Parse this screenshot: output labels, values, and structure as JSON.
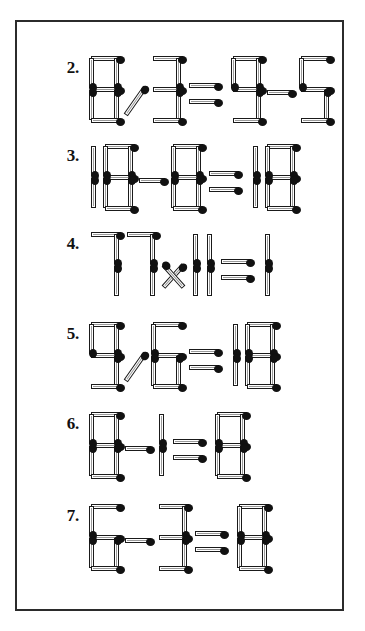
{
  "page": {
    "background_color": "#ffffff",
    "frame_color": "#2b2b2b",
    "match_body_color": "#ffffff",
    "match_outline_color": "#1a1a1a",
    "match_head_color": "#111111",
    "width": 365,
    "height": 631
  },
  "puzzles": [
    {
      "label": "2.",
      "number": "2",
      "equation_text": "8 / 3 ⇒ 9 - 5",
      "tokens": [
        {
          "kind": "digit",
          "value": "8"
        },
        {
          "kind": "operator",
          "value": "/"
        },
        {
          "kind": "digit",
          "value": "3"
        },
        {
          "kind": "operator",
          "value": "⇒"
        },
        {
          "kind": "digit",
          "value": "9"
        },
        {
          "kind": "operator",
          "value": "-"
        },
        {
          "kind": "digit",
          "value": "5"
        }
      ]
    },
    {
      "label": "3.",
      "number": "3",
      "equation_text": "18 - 8 ⇒ 18",
      "tokens": [
        {
          "kind": "digit",
          "value": "1"
        },
        {
          "kind": "digit",
          "value": "8"
        },
        {
          "kind": "operator",
          "value": "-"
        },
        {
          "kind": "digit",
          "value": "8"
        },
        {
          "kind": "operator",
          "value": "⇒"
        },
        {
          "kind": "digit",
          "value": "1"
        },
        {
          "kind": "digit",
          "value": "8"
        }
      ]
    },
    {
      "label": "4.",
      "number": "4",
      "equation_text": "77 × 11 ⇒ 1",
      "tokens": [
        {
          "kind": "digit",
          "value": "7"
        },
        {
          "kind": "digit",
          "value": "7"
        },
        {
          "kind": "operator",
          "value": "×"
        },
        {
          "kind": "digit",
          "value": "1"
        },
        {
          "kind": "digit",
          "value": "1"
        },
        {
          "kind": "operator",
          "value": "⇒"
        },
        {
          "kind": "digit",
          "value": "1"
        }
      ]
    },
    {
      "label": "5.",
      "number": "5",
      "equation_text": "9 / 6 ⇒ 18",
      "tokens": [
        {
          "kind": "digit",
          "value": "9"
        },
        {
          "kind": "operator",
          "value": "/"
        },
        {
          "kind": "digit",
          "value": "6"
        },
        {
          "kind": "operator",
          "value": "⇒"
        },
        {
          "kind": "digit",
          "value": "1"
        },
        {
          "kind": "digit",
          "value": "8"
        }
      ]
    },
    {
      "label": "6.",
      "number": "6",
      "equation_text": "8 - 1 ⇒ 8",
      "tokens": [
        {
          "kind": "digit",
          "value": "8"
        },
        {
          "kind": "operator",
          "value": "-"
        },
        {
          "kind": "digit",
          "value": "1"
        },
        {
          "kind": "operator",
          "value": "⇒"
        },
        {
          "kind": "digit",
          "value": "8"
        }
      ]
    },
    {
      "label": "7.",
      "number": "7",
      "equation_text": "6 - 3 ⇒ 8",
      "tokens": [
        {
          "kind": "digit",
          "value": "6"
        },
        {
          "kind": "operator",
          "value": "-"
        },
        {
          "kind": "digit",
          "value": "3"
        },
        {
          "kind": "operator",
          "value": "⇒"
        },
        {
          "kind": "digit",
          "value": "8"
        }
      ]
    }
  ],
  "geometry": {
    "row_tops": [
      44,
      132,
      220,
      310,
      400,
      492
    ],
    "segment_map": {
      "0": [
        "top",
        "tl",
        "tr",
        "bl",
        "br",
        "bottom"
      ],
      "1": [
        "tr",
        "br"
      ],
      "3": [
        "top",
        "tr",
        "mid",
        "br",
        "bottom"
      ],
      "5": [
        "top",
        "tl",
        "mid",
        "br",
        "bottom"
      ],
      "6": [
        "top",
        "tl",
        "mid",
        "bl",
        "br",
        "bottom"
      ],
      "7": [
        "top",
        "tr",
        "br"
      ],
      "8": [
        "top",
        "tl",
        "tr",
        "mid",
        "bl",
        "br",
        "bottom"
      ],
      "9": [
        "top",
        "tl",
        "tr",
        "mid",
        "br",
        "bottom"
      ]
    }
  }
}
